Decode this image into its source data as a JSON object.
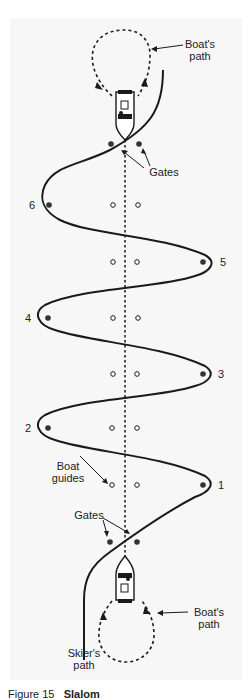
{
  "diagram": {
    "type": "slalom water-ski course",
    "labels": {
      "boats_path_top": "Boat's\npath",
      "boats_path_top_l1": "Boat's",
      "boats_path_top_l2": "path",
      "gates_top": "Gates",
      "gates_bottom": "Gates",
      "boat_guides_l1": "Boat",
      "boat_guides_l2": "guides",
      "boats_path_bottom_l1": "Boat's",
      "boats_path_bottom_l2": "path",
      "skiers_path_l1": "Skier's",
      "skiers_path_l2": "path"
    },
    "buoys": [
      {
        "number": "1",
        "side": "right"
      },
      {
        "number": "2",
        "side": "left"
      },
      {
        "number": "3",
        "side": "right"
      },
      {
        "number": "4",
        "side": "left"
      },
      {
        "number": "5",
        "side": "right"
      },
      {
        "number": "6",
        "side": "left"
      }
    ],
    "caption": {
      "prefix": "Figure 15",
      "title": "Slalom"
    },
    "colors": {
      "line": "#1a1a1a",
      "buoy_fill": "#333333",
      "panel_bg": "#f7f7f7"
    }
  }
}
